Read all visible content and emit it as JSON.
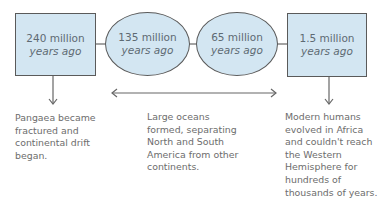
{
  "nodes": [
    {
      "id": "n1",
      "shape": "rect",
      "line1": "240 million",
      "line2": "years ago"
    },
    {
      "id": "n2",
      "shape": "ellipse",
      "line1": "135 million",
      "line2": "years ago"
    },
    {
      "id": "n3",
      "shape": "ellipse",
      "line1": "65 million",
      "line2": "years ago"
    },
    {
      "id": "n4",
      "shape": "rect",
      "line1": "1.5 million",
      "line2": "years ago"
    }
  ],
  "captions": [
    {
      "for": "n1",
      "lines": [
        "Pangaea became",
        "fractured and",
        "continental drift",
        "began."
      ]
    },
    {
      "for": "n2-n3",
      "lines": [
        "Large oceans",
        "formed, separating",
        "North and South",
        "America from other",
        "continents."
      ]
    },
    {
      "for": "n4",
      "lines": [
        "Modern humans",
        "evolved in Africa",
        "and couldn't reach",
        "the Western",
        "Hemisphere for",
        "hundreds of",
        "thousands of years."
      ]
    }
  ],
  "colors": {
    "fill": "#d3e6f2",
    "stroke": "#5a5a5a",
    "text": "#6d6d6d"
  }
}
